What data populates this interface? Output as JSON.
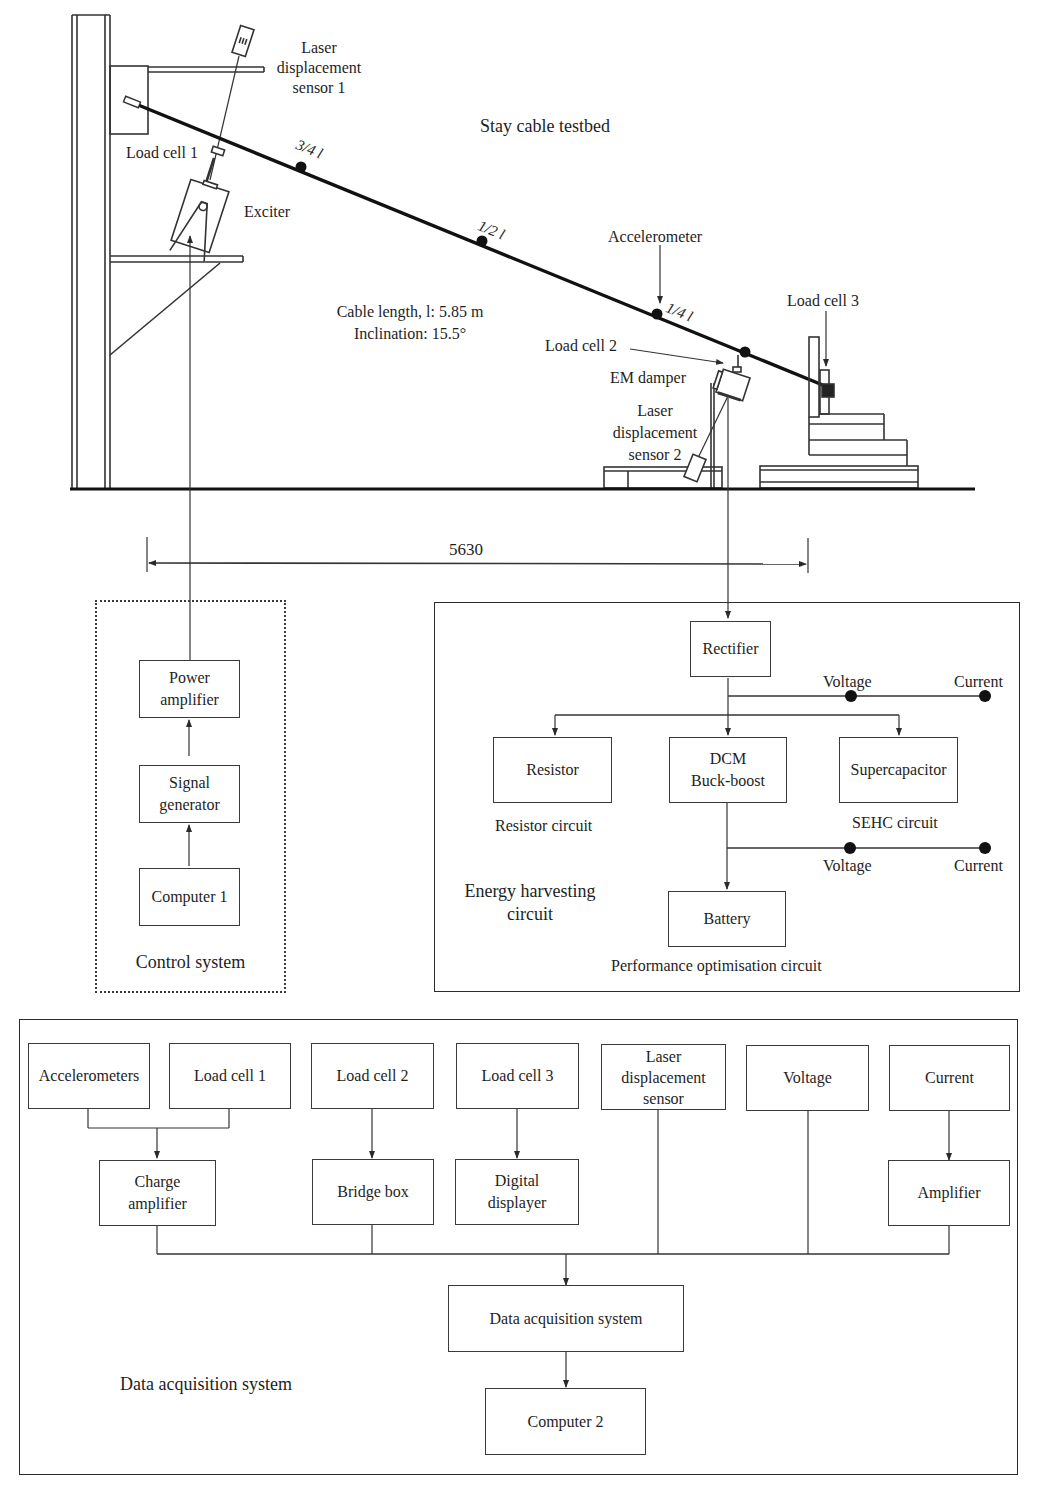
{
  "testbed": {
    "title": "Stay cable testbed",
    "cable_length": "Cable length, l: 5.85 m",
    "inclination": "Inclination: 15.5°",
    "dimension": "5630",
    "labels": {
      "laser_sensor_1": [
        "Laser",
        "displacement",
        "sensor 1"
      ],
      "load_cell_1": "Load cell 1",
      "exciter": "Exciter",
      "accelerometer": "Accelerometer",
      "load_cell_2": "Load cell 2",
      "em_damper": "EM damper",
      "laser_sensor_2": [
        "Laser",
        "displacement",
        "sensor 2"
      ],
      "load_cell_3": "Load cell 3"
    },
    "positions": {
      "three_quarter": "3/4 l",
      "half": "1/2 l",
      "quarter": "1/4 l"
    }
  },
  "control_system": {
    "title": "Control system",
    "blocks": [
      {
        "id": "power-amplifier",
        "lines": [
          "Power",
          "amplifier"
        ]
      },
      {
        "id": "signal-generator",
        "lines": [
          "Signal",
          "generator"
        ]
      },
      {
        "id": "computer-1",
        "lines": [
          "Computer 1"
        ]
      }
    ]
  },
  "energy_harvesting": {
    "title": [
      "Energy harvesting",
      "circuit"
    ],
    "rectifier": "Rectifier",
    "resistor": "Resistor",
    "dcm": [
      "DCM",
      "Buck-boost"
    ],
    "supercapacitor": "Supercapacitor",
    "battery": "Battery",
    "resistor_circuit": "Resistor circuit",
    "sehc_circuit": "SEHC circuit",
    "performance_circuit": "Performance optimisation circuit",
    "probe_top": {
      "voltage": "Voltage",
      "current": "Current"
    },
    "probe_bottom": {
      "voltage": "Voltage",
      "current": "Current"
    }
  },
  "data_acquisition": {
    "title": "Data acquisition system",
    "sensors": [
      {
        "id": "accelerometers",
        "lines": [
          "Accelerometers"
        ]
      },
      {
        "id": "load-cell-1",
        "lines": [
          "Load cell 1"
        ]
      },
      {
        "id": "load-cell-2",
        "lines": [
          "Load cell 2"
        ]
      },
      {
        "id": "load-cell-3",
        "lines": [
          "Load cell 3"
        ]
      },
      {
        "id": "laser-sensor",
        "lines": [
          "Laser",
          "displacement",
          "sensor"
        ]
      },
      {
        "id": "voltage",
        "lines": [
          "Voltage"
        ]
      },
      {
        "id": "current",
        "lines": [
          "Current"
        ]
      }
    ],
    "conditioners": [
      {
        "id": "charge-amplifier",
        "lines": [
          "Charge",
          "amplifier"
        ]
      },
      {
        "id": "bridge-box",
        "lines": [
          "Bridge box"
        ]
      },
      {
        "id": "digital-displayer",
        "lines": [
          "Digital",
          "displayer"
        ]
      },
      {
        "id": "amplifier",
        "lines": [
          "Amplifier"
        ]
      }
    ],
    "daq": "Data acquisition system",
    "computer_2": "Computer 2"
  },
  "colors": {
    "ink": "#1e1e1e",
    "line": "#3a3a3a",
    "background": "#ffffff"
  }
}
